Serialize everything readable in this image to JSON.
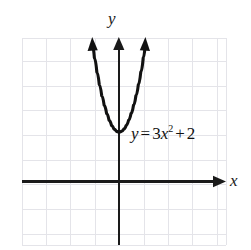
{
  "figure": {
    "title_visible": false,
    "background_color": "#ffffff",
    "grid_color": "#e3e3e8",
    "axis_color": "#1a1a1a",
    "curve_color": "#111111",
    "axis_labels": {
      "x": "x",
      "y": "y"
    },
    "equation": {
      "lhs": "y",
      "equals": "=",
      "coefficient": "3",
      "variable": "x",
      "exponent": "2",
      "plus": "+",
      "constant": "2",
      "full_text": "y = 3x^2 + 2"
    }
  },
  "chart_data": {
    "type": "line",
    "title": "",
    "xlabel": "x",
    "ylabel": "y",
    "grid": true,
    "legend_position": "none",
    "annotations": [
      {
        "text": "y = 3x^2 + 2",
        "x": 0.5,
        "y": 2.8
      }
    ],
    "xlim": [
      -4,
      4.4
    ],
    "ylim": [
      -2.6,
      5.8
    ],
    "xticks": [
      -4,
      -3,
      -2,
      -1,
      0,
      1,
      2,
      3,
      4
    ],
    "yticks": [
      -2,
      -1,
      0,
      1,
      2,
      3,
      4,
      5
    ],
    "series": [
      {
        "name": "y = 3x^2 + 2",
        "equation": "y = 3x^2 + 2",
        "vertex": [
          0,
          2
        ],
        "opens": "up",
        "arrow_ends": "both",
        "x": [
          -1.08,
          -1.0,
          -0.9,
          -0.8,
          -0.7,
          -0.6,
          -0.5,
          -0.4,
          -0.3,
          -0.2,
          -0.1,
          0,
          0.1,
          0.2,
          0.3,
          0.4,
          0.5,
          0.6,
          0.7,
          0.8,
          0.9,
          1.0,
          1.08
        ],
        "values": [
          5.5,
          5.0,
          4.43,
          3.92,
          3.47,
          3.08,
          2.75,
          2.48,
          2.27,
          2.12,
          2.03,
          2.0,
          2.03,
          2.12,
          2.27,
          2.48,
          2.75,
          3.08,
          3.47,
          3.92,
          4.43,
          5.0,
          5.5
        ]
      }
    ]
  }
}
